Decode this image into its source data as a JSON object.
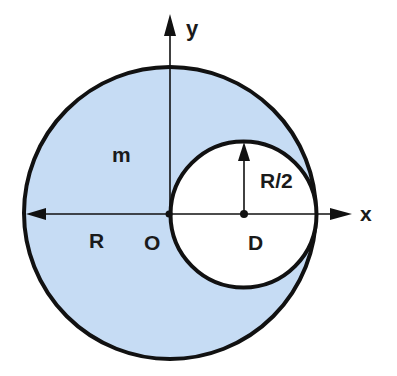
{
  "diagram": {
    "labels": {
      "y_axis": "y",
      "x_axis": "x",
      "mass": "m",
      "big_radius": "R",
      "small_radius": "R/2",
      "origin": "O",
      "hole_center": "D"
    },
    "colors": {
      "fill": "#c6dcf4",
      "stroke": "#111111",
      "hole": "#ffffff"
    }
  }
}
